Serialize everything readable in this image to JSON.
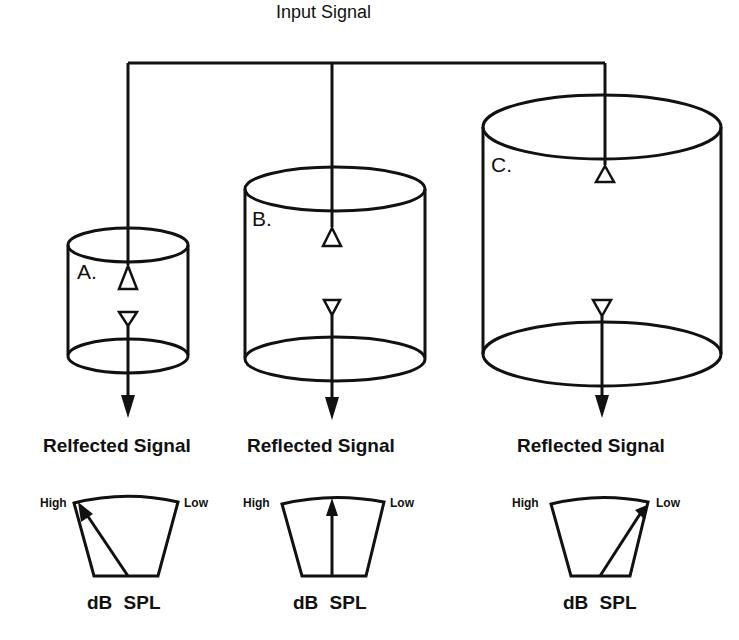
{
  "diagram": {
    "input_label": "Input Signal",
    "cylinders": [
      {
        "id": "A",
        "letter": "A.",
        "reflected_label": "Relfected Signal",
        "meter": {
          "high": "High",
          "low": "Low",
          "unit": "dB SPL",
          "needle": "high"
        }
      },
      {
        "id": "B",
        "letter": "B.",
        "reflected_label": "Reflected Signal",
        "meter": {
          "high": "High",
          "low": "Low",
          "unit": "dB SPL",
          "needle": "middle"
        }
      },
      {
        "id": "C",
        "letter": "C.",
        "reflected_label": "Reflected Signal",
        "meter": {
          "high": "High",
          "low": "Low",
          "unit": "dB SPL",
          "needle": "low"
        }
      }
    ]
  }
}
